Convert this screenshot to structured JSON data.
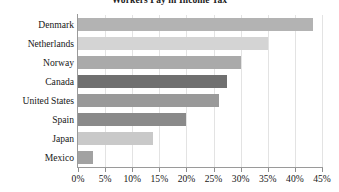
{
  "chart_data": {
    "type": "bar",
    "orientation": "horizontal",
    "title": "Workers Pay in Income Tax",
    "xlabel": "",
    "ylabel": "",
    "categories": [
      "Denmark",
      "Netherlands",
      "Norway",
      "Canada",
      "United States",
      "Spain",
      "Japan",
      "Mexico"
    ],
    "values": [
      43.3,
      35.0,
      30.0,
      27.4,
      26.0,
      20.0,
      13.8,
      2.8
    ],
    "value_labels": [
      "43.3%",
      "35.0%",
      "30.0%",
      "27.4%",
      "26.0%",
      "20.0%",
      "13.8%",
      "2.8%"
    ],
    "bar_colors": [
      "#b3b3b3",
      "#d4d4d4",
      "#aaaaaa",
      "#707070",
      "#999999",
      "#8a8a8a",
      "#c9c9c9",
      "#a2a2a2"
    ],
    "xlim": [
      0,
      45
    ],
    "xticks": [
      0,
      5,
      10,
      15,
      20,
      25,
      30,
      35,
      40,
      45
    ],
    "xtick_labels": [
      "0%",
      "5%",
      "10%",
      "15%",
      "20%",
      "25%",
      "30%",
      "35%",
      "40%",
      "45%"
    ],
    "grid": true,
    "grid_axis": "x",
    "grid_color": "#e3e3e3",
    "legend": false,
    "axis_color": "#9a9a9a",
    "background": "#ffffff"
  }
}
